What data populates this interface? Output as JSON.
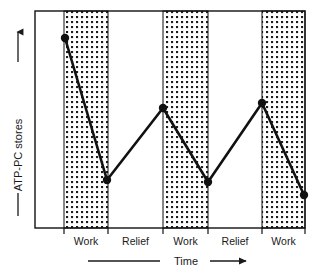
{
  "figure": {
    "kind": "line-chart",
    "background_color": "#ffffff",
    "ink_color": "#111111"
  },
  "axes": {
    "y_axis_label": "ATP-PC stores",
    "y_axis_arrow_icon": "arrow-up-icon",
    "y_axis_rule_icon": "horizontal-rule-icon",
    "x_axis_label": "Time",
    "x_axis_lead_rule_icon": "horizontal-rule-icon",
    "x_axis_arrow_icon": "arrow-right-icon",
    "plot_left": 35,
    "plot_right": 305,
    "plot_top": 11,
    "plot_bottom": 228,
    "frame_color": "#111111",
    "frame_width": 1.4
  },
  "bands": {
    "shaded_fill_pattern": "stipple-squares",
    "shaded_label": "Work",
    "unshaded_label": "Relief",
    "items": [
      {
        "label": "Work",
        "shaded": true,
        "x_start": 64,
        "x_end": 108
      },
      {
        "label": "Relief",
        "shaded": false,
        "x_start": 108,
        "x_end": 163
      },
      {
        "label": "Work",
        "shaded": true,
        "x_start": 163,
        "x_end": 208
      },
      {
        "label": "Relief",
        "shaded": false,
        "x_start": 208,
        "x_end": 262
      },
      {
        "label": "Work",
        "shaded": true,
        "x_start": 262,
        "x_end": 305
      }
    ],
    "tick_positions": [
      64,
      108,
      163,
      208,
      262,
      305
    ],
    "tick_length": 6
  },
  "chart_data": {
    "type": "line",
    "title": "",
    "subtitle": "",
    "xlabel": "Time",
    "ylabel": "ATP-PC stores",
    "grid": false,
    "legend": "none",
    "axis_ticks_labeled": false,
    "x_categories": [
      "Work",
      "Relief",
      "Work",
      "Relief",
      "Work"
    ],
    "annotations": [],
    "note": "Schematic: ATP-PC stores deplete during each Work interval and are restored during each Relief interval. Axis values are unlabeled; x/y given as relative units 0-100.",
    "x": [
      11,
      27,
      47,
      64,
      84,
      100
    ],
    "y": [
      100,
      35,
      68,
      34,
      70,
      28
    ],
    "xlim": [
      0,
      100
    ],
    "ylim": [
      0,
      100
    ],
    "points_px": [
      {
        "x": 65,
        "y": 38,
        "phase": "work-start",
        "marker": true
      },
      {
        "x": 107,
        "y": 180,
        "phase": "work-end",
        "marker": true
      },
      {
        "x": 163,
        "y": 108,
        "phase": "relief-end",
        "marker": true
      },
      {
        "x": 208,
        "y": 182,
        "phase": "work-end",
        "marker": true
      },
      {
        "x": 262,
        "y": 103,
        "phase": "relief-end",
        "marker": true
      },
      {
        "x": 304,
        "y": 195,
        "phase": "work-end",
        "marker": true
      }
    ],
    "line_color": "#111111",
    "line_width": 2.6,
    "marker_shape": "circle",
    "marker_radius": 4.2,
    "marker_color": "#111111"
  }
}
